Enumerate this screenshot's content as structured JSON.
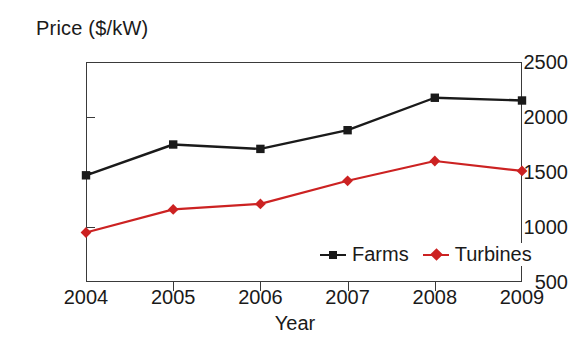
{
  "chart_data": {
    "type": "line",
    "title": "",
    "xlabel": "Year",
    "ylabel": "Price ($/kW)",
    "categories": [
      "2004",
      "2005",
      "2006",
      "2007",
      "2008",
      "2009"
    ],
    "x": [
      2004,
      2005,
      2006,
      2007,
      2008,
      2009
    ],
    "series": [
      {
        "name": "Farms",
        "color": "#1a1a1a",
        "marker": "square",
        "values": [
          1470,
          1750,
          1710,
          1880,
          2175,
          2150
        ]
      },
      {
        "name": "Turbines",
        "color": "#cc2222",
        "marker": "diamond",
        "values": [
          950,
          1160,
          1210,
          1420,
          1600,
          1510
        ]
      }
    ],
    "ylim": [
      500,
      2500
    ],
    "yticks": [
      500,
      1000,
      1500,
      2000,
      2500
    ],
    "ytick_labels": [
      "500",
      "1000",
      "1500",
      "2000",
      "2500"
    ],
    "xtick_labels": [
      "2004",
      "2005",
      "2006",
      "2007",
      "2008",
      "2009"
    ],
    "grid": false,
    "legend_position": "inside-bottom-right",
    "legend": [
      "Farms",
      "Turbines"
    ]
  },
  "axes": {
    "y_title": "Price ($/kW)",
    "x_title": "Year"
  },
  "colors": {
    "farms": "#1a1a1a",
    "turbines": "#cc2222",
    "frame": "#3a3a3a",
    "background": "#ffffff"
  }
}
